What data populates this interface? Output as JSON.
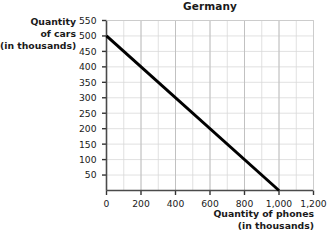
{
  "chart_data": {
    "type": "line",
    "title": "Germany",
    "xlabel_line1": "Quantity of phones",
    "xlabel_line2": "(in thousands)",
    "ylabel_line1": "Quantity",
    "ylabel_line2": "of cars",
    "ylabel_line3": "(in thousands)",
    "xlabel": "Quantity of phones (in thousands)",
    "ylabel": "Quantity of cars (in thousands)",
    "xlim": [
      0,
      1200
    ],
    "ylim": [
      0,
      550
    ],
    "xticks": [
      0,
      200,
      400,
      600,
      800,
      1000,
      1200
    ],
    "xticklabels": [
      "0",
      "200",
      "400",
      "600",
      "800",
      "1,000",
      "1,200"
    ],
    "yticks": [
      50,
      100,
      150,
      200,
      250,
      300,
      350,
      400,
      450,
      500,
      550
    ],
    "yticklabels": [
      "50",
      "100",
      "150",
      "200",
      "250",
      "300",
      "350",
      "400",
      "450",
      "500",
      "550"
    ],
    "grid": true,
    "grid_minor_x_step": 100,
    "grid_major_x_step": 200,
    "grid_y_step": 50,
    "legend": null,
    "series": [
      {
        "name": "Production possibilities frontier",
        "color": "#000000",
        "linewidth": 3,
        "x": [
          0,
          1000
        ],
        "y": [
          500,
          0
        ],
        "points": [
          [
            0,
            500
          ],
          [
            1000,
            0
          ]
        ]
      }
    ],
    "colors": {
      "line": "#000000",
      "axis": "#4a4a4a",
      "grid": "#d9d9d9",
      "text": "#1a1a1a",
      "background": "#ffffff"
    }
  }
}
